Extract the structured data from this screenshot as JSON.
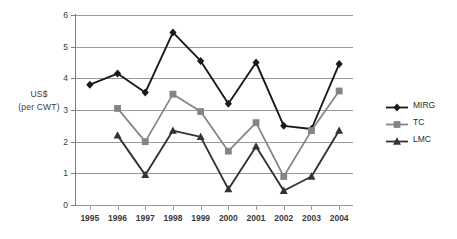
{
  "chart_data": {
    "type": "line",
    "title": "",
    "xlabel": "",
    "ylabel": "US$ (per CWT)",
    "ylabel_line1": "US$",
    "ylabel_line2": "(per CWT)",
    "categories": [
      "1995",
      "1996",
      "1997",
      "1998",
      "1999",
      "2000",
      "2001",
      "2002",
      "2003",
      "2004"
    ],
    "ylim": [
      0,
      6
    ],
    "yticks": [
      0,
      1,
      2,
      3,
      4,
      5,
      6
    ],
    "ytick_labels": [
      "0",
      "1",
      "2",
      "3",
      "4",
      "5",
      "6"
    ],
    "grid": true,
    "grid_axis": "y",
    "legend_position": "right",
    "series": [
      {
        "name": "MIRG",
        "marker": "diamond",
        "color": "#1a1a1a",
        "values": [
          3.8,
          4.15,
          3.55,
          5.45,
          4.55,
          3.2,
          4.5,
          2.5,
          2.4,
          4.45
        ]
      },
      {
        "name": "TC",
        "marker": "square",
        "color": "#848484",
        "values": [
          null,
          3.05,
          2.0,
          3.5,
          2.95,
          1.7,
          2.6,
          0.9,
          2.35,
          3.6
        ]
      },
      {
        "name": "LMC",
        "marker": "triangle",
        "color": "#333333",
        "values": [
          null,
          2.2,
          0.95,
          2.35,
          2.15,
          0.5,
          1.85,
          0.45,
          0.9,
          2.35
        ]
      }
    ]
  },
  "legend": {
    "items": [
      {
        "label": "MIRG"
      },
      {
        "label": "TC"
      },
      {
        "label": "LMC"
      }
    ]
  }
}
